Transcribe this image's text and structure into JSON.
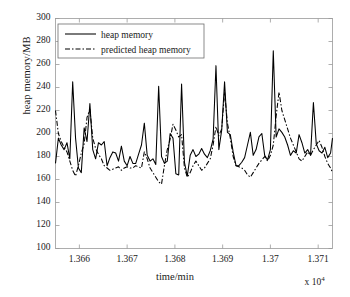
{
  "chart_data": {
    "type": "line",
    "title": "",
    "xlabel": "time/min",
    "ylabel": "heap memory/MB",
    "x_exponent_label": "x 10",
    "x_exponent_power": "4",
    "x_scale_factor": 10000,
    "xlim": [
      13655,
      13713
    ],
    "ylim": [
      100,
      300
    ],
    "xticks": [
      13660,
      13670,
      13680,
      13690,
      13700,
      13710
    ],
    "xticklabels": [
      "1.366",
      "1.367",
      "1.368",
      "1.369",
      "1.37",
      "1.371"
    ],
    "yticks": [
      100,
      120,
      140,
      160,
      180,
      200,
      220,
      240,
      260,
      280,
      300
    ],
    "yticklabels": [
      "100",
      "120",
      "140",
      "160",
      "180",
      "200",
      "220",
      "240",
      "260",
      "280",
      "300"
    ],
    "grid": false,
    "legend_position": "upper-left",
    "series": [
      {
        "name": "heap memory",
        "style": "solid",
        "color": "#000000",
        "x": [
          13655.0,
          13655.6,
          13656.2,
          13656.8,
          13657.4,
          13658.0,
          13658.6,
          13659.2,
          13659.8,
          13660.4,
          13661.0,
          13661.6,
          13662.2,
          13662.8,
          13663.4,
          13664.0,
          13664.6,
          13665.2,
          13665.8,
          13666.4,
          13667.0,
          13667.6,
          13668.2,
          13668.8,
          13669.4,
          13670.0,
          13670.6,
          13671.2,
          13671.8,
          13672.4,
          13673.0,
          13673.6,
          13674.2,
          13674.8,
          13675.4,
          13676.0,
          13676.6,
          13677.2,
          13677.8,
          13678.4,
          13679.0,
          13679.6,
          13680.2,
          13680.8,
          13681.4,
          13682.0,
          13682.6,
          13683.2,
          13683.8,
          13684.4,
          13685.0,
          13685.6,
          13686.2,
          13686.8,
          13687.4,
          13688.0,
          13688.6,
          13689.2,
          13689.8,
          13690.4,
          13691.0,
          13691.6,
          13692.2,
          13692.8,
          13693.4,
          13694.0,
          13694.6,
          13695.2,
          13695.8,
          13696.4,
          13697.0,
          13697.6,
          13698.2,
          13698.8,
          13699.4,
          13700.0,
          13700.6,
          13701.2,
          13701.8,
          13702.4,
          13703.0,
          13703.6,
          13704.2,
          13704.8,
          13705.4,
          13706.0,
          13706.6,
          13707.2,
          13707.8,
          13708.4,
          13709.0,
          13709.6,
          13710.2,
          13710.8,
          13711.4,
          13712.0,
          13712.6,
          13713.0
        ],
        "values": [
          174,
          196,
          190,
          186,
          192,
          178,
          245,
          196,
          170,
          166,
          205,
          193,
          226,
          186,
          178,
          192,
          190,
          193,
          172,
          179,
          184,
          183,
          176,
          189,
          176,
          172,
          180,
          174,
          174,
          182,
          190,
          209,
          181,
          176,
          178,
          173,
          241,
          180,
          174,
          176,
          200,
          196,
          165,
          164,
          243,
          175,
          163,
          181,
          186,
          180,
          182,
          187,
          182,
          179,
          185,
          195,
          259,
          186,
          203,
          245,
          201,
          199,
          184,
          172,
          172,
          175,
          179,
          190,
          201,
          181,
          186,
          197,
          200,
          181,
          177,
          186,
          272,
          197,
          204,
          201,
          197,
          190,
          181,
          185,
          183,
          199,
          192,
          183,
          186,
          181,
          227,
          191,
          185,
          183,
          188,
          179,
          183,
          196
        ]
      },
      {
        "name": "predicted heap memory",
        "style": "dash-dot",
        "color": "#000000",
        "x": [
          13655.0,
          13655.6,
          13656.2,
          13656.8,
          13657.4,
          13658.0,
          13658.6,
          13659.2,
          13659.8,
          13660.4,
          13661.0,
          13661.6,
          13662.2,
          13662.8,
          13663.4,
          13664.0,
          13664.6,
          13665.2,
          13665.8,
          13666.4,
          13667.0,
          13667.6,
          13668.2,
          13668.8,
          13669.4,
          13670.0,
          13670.6,
          13671.2,
          13671.8,
          13672.4,
          13673.0,
          13673.6,
          13674.2,
          13674.8,
          13675.4,
          13676.0,
          13676.6,
          13677.2,
          13677.8,
          13678.4,
          13679.0,
          13679.6,
          13680.2,
          13680.8,
          13681.4,
          13682.0,
          13682.6,
          13683.2,
          13683.8,
          13684.4,
          13685.0,
          13685.6,
          13686.2,
          13686.8,
          13687.4,
          13688.0,
          13688.6,
          13689.2,
          13689.8,
          13690.4,
          13691.0,
          13691.6,
          13692.2,
          13692.8,
          13693.4,
          13694.0,
          13694.6,
          13695.2,
          13695.8,
          13696.4,
          13697.0,
          13697.6,
          13698.2,
          13698.8,
          13699.4,
          13700.0,
          13700.6,
          13701.2,
          13701.8,
          13702.4,
          13703.0,
          13703.6,
          13704.2,
          13704.8,
          13705.4,
          13706.0,
          13706.6,
          13707.2,
          13707.8,
          13708.4,
          13709.0,
          13709.6,
          13710.2,
          13710.8,
          13711.4,
          13712.0,
          13712.6,
          13713.0
        ],
        "values": [
          220,
          200,
          193,
          188,
          184,
          176,
          168,
          163,
          172,
          183,
          191,
          214,
          221,
          196,
          187,
          182,
          178,
          172,
          170,
          168,
          169,
          170,
          171,
          168,
          170,
          171,
          170,
          170,
          172,
          171,
          170,
          184,
          178,
          170,
          166,
          162,
          158,
          156,
          172,
          186,
          195,
          208,
          203,
          197,
          199,
          170,
          162,
          166,
          172,
          176,
          172,
          168,
          170,
          174,
          178,
          190,
          206,
          198,
          204,
          236,
          209,
          196,
          180,
          172,
          171,
          170,
          168,
          164,
          162,
          166,
          170,
          174,
          177,
          180,
          176,
          181,
          190,
          215,
          236,
          220,
          212,
          204,
          196,
          190,
          184,
          178,
          176,
          180,
          184,
          181,
          186,
          190,
          194,
          188,
          180,
          174,
          170,
          166
        ]
      }
    ]
  },
  "legend": {
    "items": [
      {
        "label": "heap memory",
        "style": "solid"
      },
      {
        "label": "predicted heap memory",
        "style": "dash-dot"
      }
    ]
  }
}
